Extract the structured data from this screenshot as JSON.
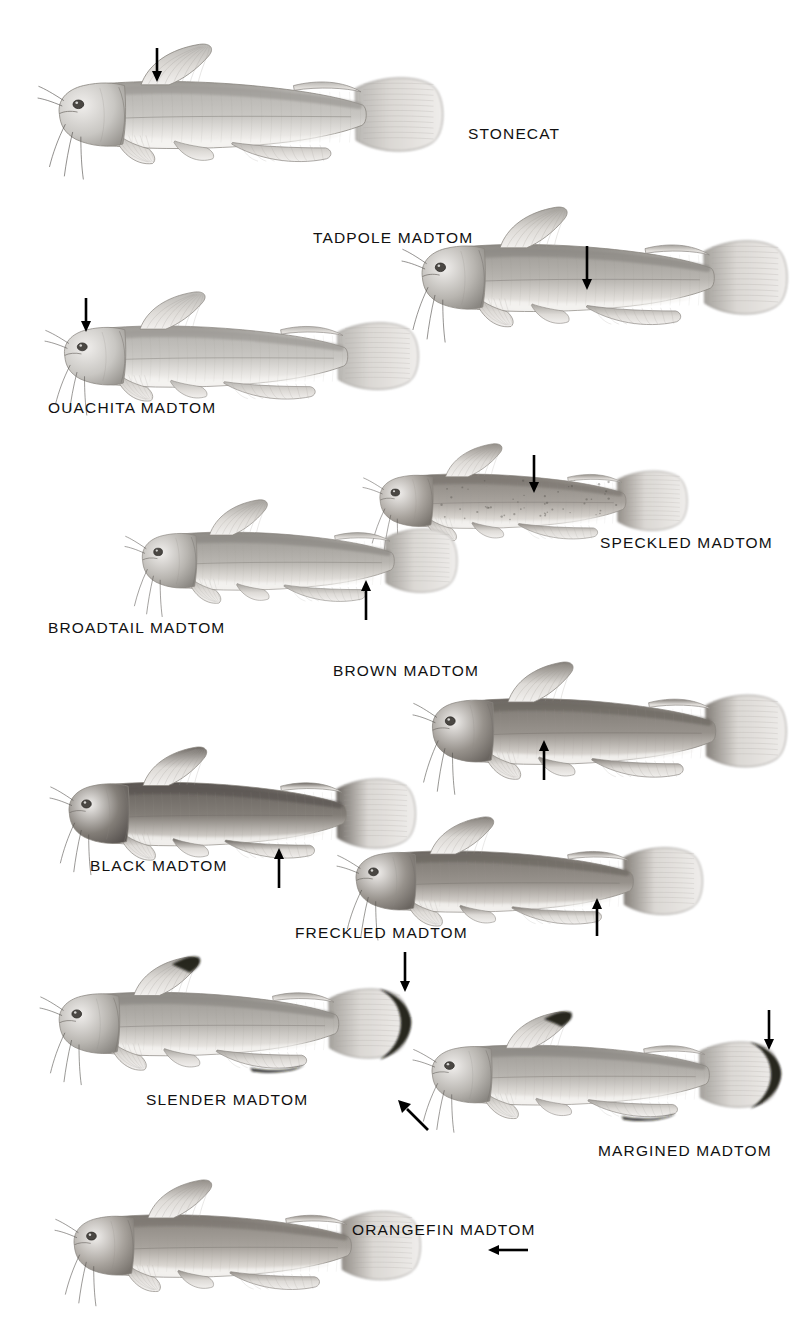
{
  "plate": {
    "title": "Madtoms and Stonecat identification plate",
    "background_color": "#ffffff",
    "ink_color": "#111111",
    "medium": "graphite pencil illustration, grayscale",
    "width": 810,
    "height": 1333
  },
  "species": [
    {
      "id": "stonecat",
      "label": "STONECAT",
      "label_x": 468,
      "label_y": 126,
      "fish_x": 38,
      "fish_y": 42,
      "fish_w": 412,
      "fish_h": 148,
      "tone": "light",
      "dark_fin_margin": false,
      "arrow": {
        "direction": "down",
        "x": 150,
        "y": 48,
        "length": 34,
        "target": "adipose-fin"
      }
    },
    {
      "id": "tadpole-madtom",
      "label": "TADPOLE MADTOM",
      "label_x": 313,
      "label_y": 230,
      "fish_x": 402,
      "fish_y": 205,
      "fish_w": 392,
      "fish_h": 148,
      "tone": "mid",
      "dark_fin_margin": false,
      "arrow": {
        "direction": "down",
        "x": 580,
        "y": 246,
        "length": 44,
        "target": "body-side"
      }
    },
    {
      "id": "ouachita-madtom",
      "label": "OUACHITA MADTOM",
      "label_x": 48,
      "label_y": 400,
      "fish_x": 45,
      "fish_y": 290,
      "fish_w": 380,
      "fish_h": 135,
      "tone": "light",
      "dark_fin_margin": false,
      "arrow": {
        "direction": "down",
        "x": 79,
        "y": 298,
        "length": 34,
        "target": "head-top"
      }
    },
    {
      "id": "speckled-madtom",
      "label": "SPECKLED MADTOM",
      "label_x": 600,
      "label_y": 535,
      "fish_x": 363,
      "fish_y": 442,
      "fish_w": 330,
      "fish_h": 120,
      "tone": "mid-dark",
      "dark_fin_margin": false,
      "speckled": true,
      "arrow": {
        "direction": "down",
        "x": 527,
        "y": 455,
        "length": 38,
        "target": "body-side"
      }
    },
    {
      "id": "broadtail-madtom",
      "label": "BROADTAIL MADTOM",
      "label_x": 48,
      "label_y": 620,
      "fish_x": 125,
      "fish_y": 498,
      "fish_w": 338,
      "fish_h": 128,
      "tone": "mid",
      "dark_fin_margin": false,
      "arrow": {
        "direction": "up",
        "x": 359,
        "y": 580,
        "length": 40,
        "target": "caudal-base"
      }
    },
    {
      "id": "brown-madtom",
      "label": "BROWN MADTOM",
      "label_x": 333,
      "label_y": 663,
      "fish_x": 413,
      "fish_y": 660,
      "fish_w": 380,
      "fish_h": 145,
      "tone": "dark",
      "dark_fin_margin": false,
      "arrow": {
        "direction": "up",
        "x": 537,
        "y": 740,
        "length": 40,
        "target": "anal-fin"
      }
    },
    {
      "id": "black-madtom",
      "label": "BLACK MADTOM",
      "label_x": 90,
      "label_y": 858,
      "fish_x": 50,
      "fish_y": 745,
      "fish_w": 372,
      "fish_h": 140,
      "tone": "very-dark",
      "dark_fin_margin": false,
      "arrow": {
        "direction": "up",
        "x": 272,
        "y": 848,
        "length": 40,
        "target": "anal-fin"
      }
    },
    {
      "id": "freckled-madtom",
      "label": "FRECKLED MADTOM",
      "label_x": 295,
      "label_y": 925,
      "fish_x": 337,
      "fish_y": 815,
      "fish_w": 372,
      "fish_h": 135,
      "tone": "dark",
      "dark_fin_margin": false,
      "arrow": {
        "direction": "up",
        "x": 590,
        "y": 898,
        "length": 38,
        "target": "anal-fin"
      }
    },
    {
      "id": "slender-madtom",
      "label": "SLENDER MADTOM",
      "label_x": 146,
      "label_y": 1092,
      "fish_x": 40,
      "fish_y": 955,
      "fish_w": 375,
      "fish_h": 140,
      "tone": "mid",
      "dark_fin_margin": true,
      "arrow": {
        "direction": "down",
        "x": 398,
        "y": 952,
        "length": 40,
        "target": "caudal-fin-margin"
      }
    },
    {
      "id": "margined-madtom",
      "label": "MARGINED MADTOM",
      "label_x": 598,
      "label_y": 1143,
      "fish_x": 413,
      "fish_y": 1010,
      "fish_w": 372,
      "fish_h": 132,
      "tone": "mid",
      "dark_fin_margin": true,
      "arrow": {
        "direction": "down",
        "x": 762,
        "y": 1010,
        "length": 40,
        "target": "caudal-fin-margin"
      },
      "arrow2": {
        "direction": "up-left",
        "x": 398,
        "y": 1100,
        "length": 30,
        "target": "chin-barbel"
      }
    },
    {
      "id": "orangefin-madtom",
      "label": "ORANGEFIN MADTOM",
      "label_x": 352,
      "label_y": 1222,
      "fish_x": 55,
      "fish_y": 1178,
      "fish_w": 372,
      "fish_h": 138,
      "tone": "mid-dark",
      "dark_fin_margin": false,
      "arrow": {
        "direction": "left",
        "x": 488,
        "y": 1243,
        "length": 40,
        "target": "caudal-fin"
      }
    }
  ]
}
